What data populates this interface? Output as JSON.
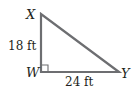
{
  "diagram": {
    "type": "right-triangle",
    "vertices": {
      "X": {
        "label": "X"
      },
      "W": {
        "label": "W"
      },
      "Y": {
        "label": "Y"
      }
    },
    "sides": {
      "XW": {
        "label": "18 ft"
      },
      "WY": {
        "label": "24 ft"
      }
    },
    "right_angle_at": "W",
    "colors": {
      "stroke": "#6d6e71",
      "text": "#231f20"
    }
  }
}
